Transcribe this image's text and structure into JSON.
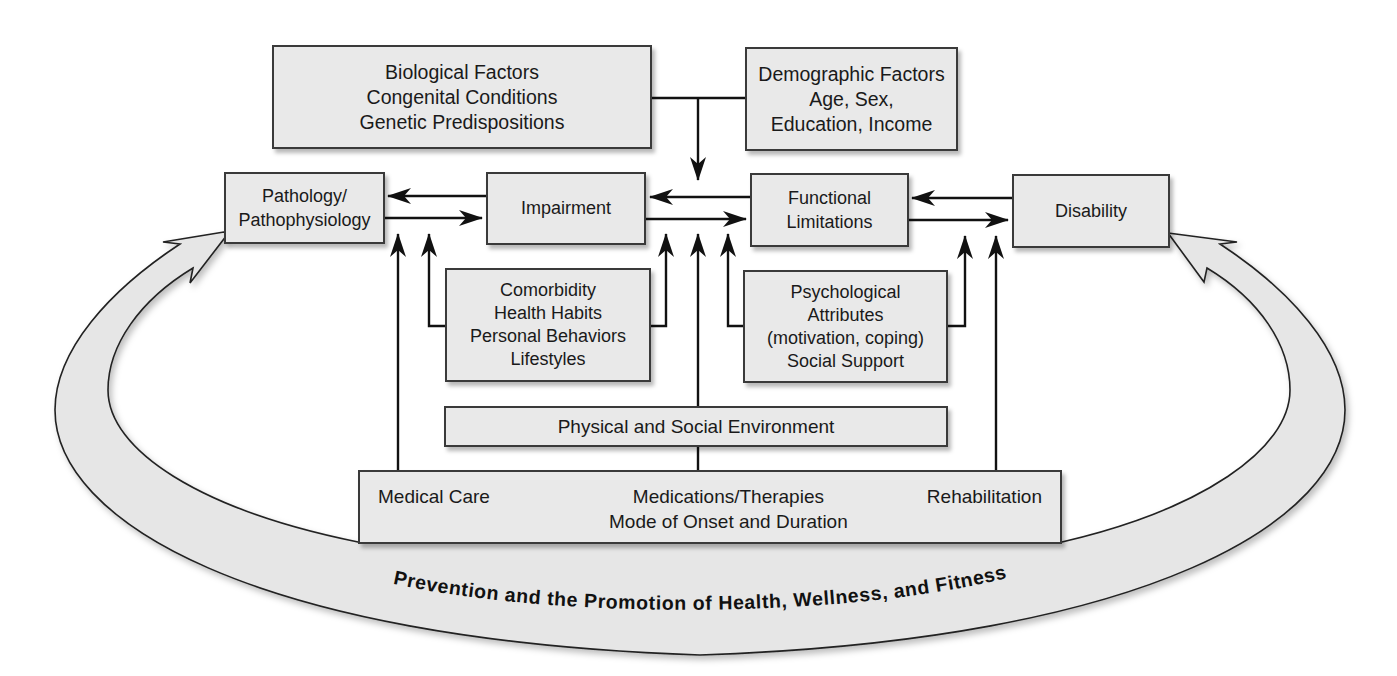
{
  "diagram": {
    "type": "disablement-model",
    "colors": {
      "box_fill": "#e9e9e9",
      "box_border": "#3a3a3a",
      "arrow": "#111111",
      "ring_fill": "#e6e6e6"
    },
    "boxes": {
      "biological": {
        "lines": [
          "Biological Factors",
          "Congenital Conditions",
          "Genetic Predispositions"
        ]
      },
      "demographic": {
        "lines": [
          "Demographic Factors",
          "Age, Sex,",
          "Education, Income"
        ]
      },
      "pathology": {
        "lines": [
          "Pathology/",
          "Pathophysiology"
        ]
      },
      "impairment": {
        "lines": [
          "Impairment"
        ]
      },
      "functional": {
        "lines": [
          "Functional",
          "Limitations"
        ]
      },
      "disability": {
        "lines": [
          "Disability"
        ]
      },
      "comorbidity": {
        "lines": [
          "Comorbidity",
          "Health Habits",
          "Personal Behaviors",
          "Lifestyles"
        ]
      },
      "psychological": {
        "lines": [
          "Psychological",
          "Attributes",
          "(motivation, coping)",
          "Social Support"
        ]
      },
      "environment": {
        "lines": [
          "Physical and Social Environment"
        ]
      },
      "care": {
        "left": "Medical Care",
        "center": [
          "Medications/Therapies",
          "Mode of Onset and Duration"
        ],
        "right": "Rehabilitation"
      }
    },
    "ring_label": "Prevention and the Promotion of Health, Wellness, and Fitness",
    "edges": [
      {
        "from": "impairment",
        "to": "pathology"
      },
      {
        "from": "pathology",
        "to": "impairment"
      },
      {
        "from": "functional",
        "to": "impairment"
      },
      {
        "from": "impairment",
        "to": "functional"
      },
      {
        "from": "disability",
        "to": "functional"
      },
      {
        "from": "functional",
        "to": "disability"
      },
      {
        "from": "biological+demographic",
        "to": "impairment-functional-link"
      },
      {
        "from": "comorbidity",
        "to": "pathology-impairment-link"
      },
      {
        "from": "comorbidity",
        "to": "impairment-functional-link"
      },
      {
        "from": "psychological",
        "to": "impairment-functional-link"
      },
      {
        "from": "psychological",
        "to": "functional-disability-link"
      },
      {
        "from": "environment",
        "to": "impairment-functional-link"
      },
      {
        "from": "medical-care",
        "to": "pathology-impairment-link"
      },
      {
        "from": "rehabilitation",
        "to": "functional-disability-link"
      },
      {
        "from": "prevention-ring",
        "to": "pathology"
      },
      {
        "from": "prevention-ring",
        "to": "disability"
      }
    ]
  }
}
